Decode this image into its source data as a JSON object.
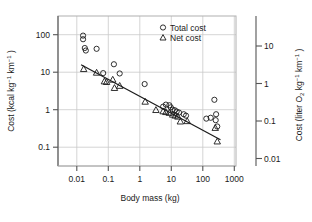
{
  "chart_data": {
    "type": "scatter",
    "title": "",
    "xlabel": "Body mass (kg)",
    "ylabel": "Cost (kcal kg⁻¹ km⁻¹)",
    "y2label": "Cost (liter O₂ kg⁻¹ km⁻¹)",
    "xscale": "log",
    "yscale": "log",
    "xlim": [
      0.003,
      3000
    ],
    "ylim": [
      0.03,
      300
    ],
    "y2lim": [
      0.006,
      60
    ],
    "grid": true,
    "legend_position": "top-right",
    "xticks": [
      "0.01",
      "0.1",
      "1",
      "10",
      "100",
      "1000"
    ],
    "xtick_values": [
      0.01,
      0.1,
      1,
      10,
      100,
      1000
    ],
    "yticks": [
      "100",
      "10",
      "1",
      "0.1"
    ],
    "ytick_values": [
      100,
      10,
      1,
      0.1
    ],
    "y2ticks": [
      "10",
      "1",
      "0.1",
      "0.01"
    ],
    "y2tick_values": [
      10,
      1,
      0.1,
      0.01
    ],
    "legend": [
      {
        "label": "Total cost",
        "marker": "circle"
      },
      {
        "label": "Net cost",
        "marker": "triangle"
      }
    ],
    "series": [
      {
        "name": "Total cost",
        "marker": "circle",
        "points": [
          [
            0.021,
            90
          ],
          [
            0.021,
            72
          ],
          [
            0.024,
            42
          ],
          [
            0.026,
            36
          ],
          [
            0.06,
            40
          ],
          [
            0.1,
            9.0
          ],
          [
            0.23,
            15.5
          ],
          [
            0.36,
            8.8
          ],
          [
            2.5,
            4.6
          ],
          [
            10.5,
            1.15
          ],
          [
            13,
            1.3
          ],
          [
            17,
            1.25
          ],
          [
            19,
            1.1
          ],
          [
            22,
            0.95
          ],
          [
            26,
            0.92
          ],
          [
            30,
            0.85
          ],
          [
            36,
            0.8
          ],
          [
            52,
            0.72
          ],
          [
            62,
            0.66
          ],
          [
            300,
            0.55
          ],
          [
            420,
            0.58
          ],
          [
            560,
            1.75
          ],
          [
            620,
            0.5
          ],
          [
            640,
            0.72
          ],
          [
            700,
            0.34
          ]
        ]
      },
      {
        "name": "Net cost",
        "marker": "triangle",
        "points": [
          [
            0.022,
            11.5
          ],
          [
            0.06,
            9.2
          ],
          [
            0.11,
            5.4
          ],
          [
            0.13,
            5.2
          ],
          [
            0.21,
            6.0
          ],
          [
            0.24,
            3.6
          ],
          [
            0.36,
            4.1
          ],
          [
            2.6,
            1.55
          ],
          [
            6.0,
            0.93
          ],
          [
            10.5,
            0.86
          ],
          [
            13,
            0.82
          ],
          [
            17,
            0.78
          ],
          [
            22,
            0.7
          ],
          [
            27,
            0.66
          ],
          [
            33,
            0.62
          ],
          [
            40,
            0.46
          ],
          [
            68,
            0.47
          ],
          [
            600,
            0.31
          ],
          [
            700,
            0.135
          ]
        ]
      }
    ],
    "fit_line": {
      "name": "regression",
      "x_start": 0.018,
      "y_start": 15.0,
      "x_end": 900,
      "y_end": 0.15
    }
  }
}
